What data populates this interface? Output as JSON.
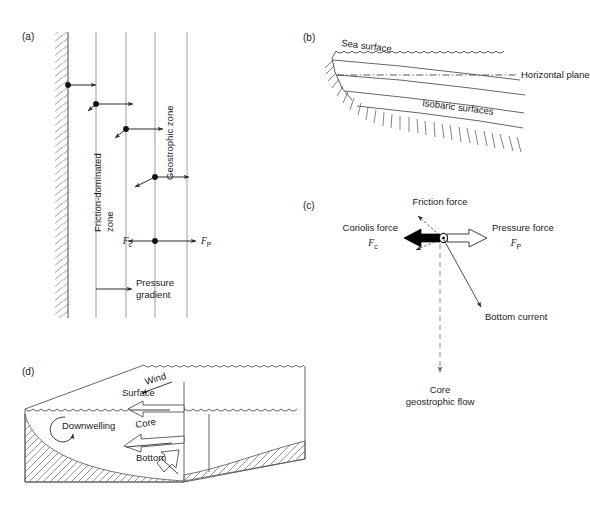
{
  "figure": {
    "background": "#ffffff",
    "line_color": "#3a3a3a",
    "text_color": "#1a1a1a"
  },
  "panels": {
    "a": {
      "tag": "(a)",
      "labels": {
        "friction_zone_line1": "Friction-dominated",
        "friction_zone_line2": "zone",
        "geostrophic_zone": "Geostrophic zone",
        "pressure_gradient_line1": "Pressure",
        "pressure_gradient_line2": "gradient",
        "fc": "F",
        "fc_sub": "c",
        "fp": "F",
        "fp_sub": "P"
      },
      "vertical_lines_x": [
        68,
        96,
        126,
        155,
        187
      ],
      "wall": {
        "x_left": 55,
        "x_right": 68,
        "y_top": 32,
        "y_bottom": 318,
        "hatch": "diagonal"
      },
      "velocity_vectors": [
        {
          "dot_x": 68,
          "y": 85,
          "tip_x": 96,
          "has_back_arrow": false
        },
        {
          "dot_x": 96,
          "y": 104,
          "tip_x": 133,
          "has_back_arrow": true
        },
        {
          "dot_x": 126,
          "y": 129,
          "tip_x": 163,
          "has_back_arrow": true
        },
        {
          "dot_x": 155,
          "y": 177,
          "tip_x": 187,
          "has_back_arrow": true
        }
      ],
      "force_balance": {
        "dot_x": 155,
        "y": 241,
        "fc_tip_x": 126,
        "fp_tip_x": 194
      }
    },
    "b": {
      "tag": "(b)",
      "labels": {
        "sea_surface": "Sea surface",
        "horizontal_plane": "Horizontal plane",
        "isobaric_surfaces": "Isobaric surfaces"
      }
    },
    "c": {
      "tag": "(c)",
      "labels": {
        "friction_force": "Friction force",
        "coriolis_force": "Coriolis force",
        "coriolis_sym": "F",
        "coriolis_sub": "c",
        "pressure_force": "Pressure force",
        "pressure_sym": "F",
        "pressure_sub": "P",
        "bottom_current": "Bottom current",
        "core_line1": "Core",
        "core_line2": "geostrophic flow"
      },
      "origin": {
        "x": 443,
        "y": 238
      },
      "arrows": {
        "coriolis": {
          "color": "#000000",
          "direction": "left",
          "style": "solid-filled"
        },
        "pressure": {
          "color": "#ffffff",
          "direction": "right",
          "style": "open-outline"
        },
        "friction": {
          "color": "#000000",
          "direction": "up-left",
          "style": "dashed-outline-small"
        },
        "bottom_current": {
          "direction": "down-right",
          "style": "thin-line"
        },
        "core_geostrophic": {
          "direction": "down",
          "style": "dashed"
        }
      }
    },
    "d": {
      "tag": "(d)",
      "labels": {
        "wind": "Wind",
        "surface": "Surface",
        "downwelling": "Downwelling",
        "core": "Core",
        "bottom": "Bottom"
      }
    }
  }
}
